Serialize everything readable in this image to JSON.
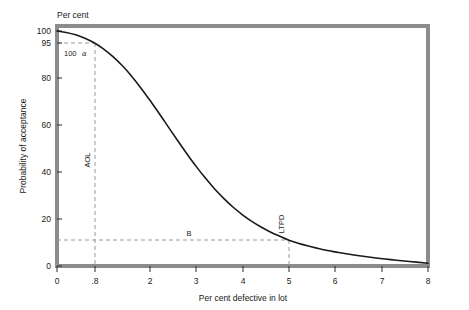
{
  "figure": {
    "background": "#ffffff",
    "frame_color": "#8c8c8c",
    "curve_color": "#1a1a1a",
    "guide_color": "#9a9a9a",
    "text_color": "#1a1a1a"
  },
  "axes": {
    "y_unit_label": "Per cent",
    "y_title": "Probability of acceptance",
    "x_title": "Per cent defective in lot"
  },
  "annotations": {
    "alpha_prefix": "100",
    "alpha_symbol": "α",
    "aol": "AOL",
    "ltpd": "LTPD",
    "beta": "B"
  },
  "chart_data": {
    "type": "line",
    "title": "",
    "subtitle": "",
    "xlabel": "Per cent defective in lot",
    "ylabel": "Probability of acceptance",
    "y_unit": "Per cent",
    "xlim": [
      0,
      8
    ],
    "ylim": [
      0,
      100
    ],
    "grid": false,
    "legend": false,
    "legend_position": "none",
    "xticks": [
      0,
      0.8,
      2,
      3,
      4,
      5,
      6,
      7,
      8
    ],
    "xticklabels": [
      "0",
      ".8",
      "2",
      "3",
      "4",
      "5",
      "6",
      "7",
      "8"
    ],
    "yticks": [
      0,
      20,
      40,
      60,
      80,
      95,
      100
    ],
    "yticklabels": [
      "0",
      "20",
      "40",
      "60",
      "80",
      "95",
      "100"
    ],
    "series": [
      {
        "name": "Operating characteristic curve",
        "x": [
          0,
          0.2,
          0.4,
          0.6,
          0.8,
          1.0,
          1.2,
          1.4,
          1.6,
          1.8,
          2.0,
          2.2,
          2.4,
          2.6,
          2.8,
          3.0,
          3.2,
          3.4,
          3.6,
          3.8,
          4.0,
          4.2,
          4.4,
          4.6,
          4.8,
          5.0,
          5.2,
          5.4,
          5.6,
          5.8,
          6.0,
          6.4,
          6.8,
          7.2,
          7.6,
          8.0
        ],
        "y": [
          100,
          99.4,
          98.4,
          96.9,
          95.0,
          92.4,
          89.2,
          85.4,
          81.0,
          76.0,
          70.6,
          65.0,
          59.2,
          53.4,
          47.8,
          42.4,
          37.4,
          32.8,
          28.7,
          25.0,
          21.8,
          19.0,
          16.6,
          14.5,
          12.7,
          11.0,
          9.7,
          8.6,
          7.6,
          6.7,
          6.0,
          4.7,
          3.6,
          2.7,
          1.9,
          1.2
        ]
      }
    ],
    "markers": [
      {
        "name": "AOL",
        "x": 0.8,
        "y": 95,
        "label": "AOL",
        "note": "Acceptable quality level; producer's risk point"
      },
      {
        "name": "LTPD",
        "x": 5.0,
        "y": 11,
        "label": "LTPD",
        "note": "Lot tolerance per cent defective; consumer's risk point"
      }
    ],
    "guides": [
      {
        "orientation": "horizontal",
        "value": 95,
        "x_from": 0,
        "x_to": 0.8,
        "style": "dashed",
        "label": "100 α"
      },
      {
        "orientation": "vertical",
        "value": 0.8,
        "y_from": 0,
        "y_to": 95,
        "style": "dashed",
        "label": "AOL"
      },
      {
        "orientation": "horizontal",
        "value": 11,
        "x_from": 0,
        "x_to": 5.0,
        "style": "dashed",
        "label": "B"
      },
      {
        "orientation": "vertical",
        "value": 5.0,
        "y_from": 0,
        "y_to": 11,
        "style": "dashed",
        "label": "LTPD"
      }
    ]
  }
}
